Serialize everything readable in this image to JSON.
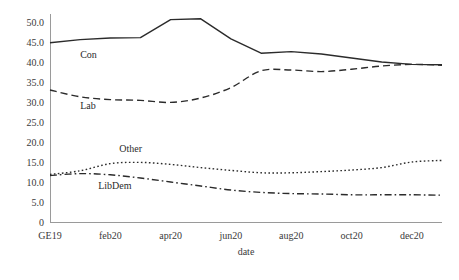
{
  "chart_data": {
    "type": "line",
    "title": "",
    "xlabel": "date",
    "ylabel": "",
    "grid": false,
    "legend_position": "inline-labels",
    "xlim": [
      0,
      13
    ],
    "ylim": [
      0,
      52
    ],
    "x_tick_labels": [
      "GE19",
      "feb20",
      "apr20",
      "jun20",
      "aug20",
      "oct20",
      "dec20"
    ],
    "x_tick_values": [
      0,
      2,
      4,
      6,
      8,
      10,
      12
    ],
    "y_tick_labels": [
      "0",
      "5.0",
      "10.0",
      "15.0",
      "20.0",
      "25.0",
      "30.0",
      "35.0",
      "40.0",
      "45.0",
      "50.0"
    ],
    "y_tick_values": [
      0,
      5,
      10,
      15,
      20,
      25,
      30,
      35,
      40,
      45,
      50
    ],
    "x": [
      0,
      1,
      2,
      3,
      4,
      5,
      6,
      7,
      8,
      9,
      10,
      11,
      12,
      13
    ],
    "series": [
      {
        "name": "Con",
        "line_style": "solid",
        "color": "#2b2b2b",
        "label_x": 1.0,
        "label_y": 41.0,
        "values": [
          44.8,
          45.6,
          46.0,
          46.1,
          50.6,
          50.8,
          45.8,
          42.2,
          42.6,
          42.0,
          41.0,
          40.0,
          39.4,
          39.3
        ]
      },
      {
        "name": "Lab",
        "line_style": "dashed",
        "color": "#2b2b2b",
        "label_x": 1.0,
        "label_y": 28.2,
        "values": [
          33.0,
          31.3,
          30.6,
          30.4,
          29.9,
          31.0,
          33.6,
          37.8,
          38.0,
          37.6,
          38.2,
          39.0,
          39.4,
          39.2
        ]
      },
      {
        "name": "Other",
        "line_style": "dotted",
        "color": "#2b2b2b",
        "label_x": 2.3,
        "label_y": 17.6,
        "values": [
          11.9,
          12.8,
          14.6,
          14.9,
          14.4,
          13.6,
          12.9,
          12.3,
          12.3,
          12.6,
          13.0,
          13.6,
          15.0,
          15.4
        ]
      },
      {
        "name": "LibDem",
        "line_style": "dashdot",
        "color": "#2b2b2b",
        "label_x": 1.6,
        "label_y": 8.3,
        "values": [
          11.6,
          12.1,
          11.8,
          11.0,
          10.0,
          9.0,
          8.0,
          7.4,
          7.1,
          7.0,
          6.8,
          6.8,
          6.8,
          6.7
        ]
      }
    ]
  },
  "figure": {
    "background": "#ffffff",
    "axis_color": "#9a9a9a",
    "text_color": "#2b2b2b"
  }
}
